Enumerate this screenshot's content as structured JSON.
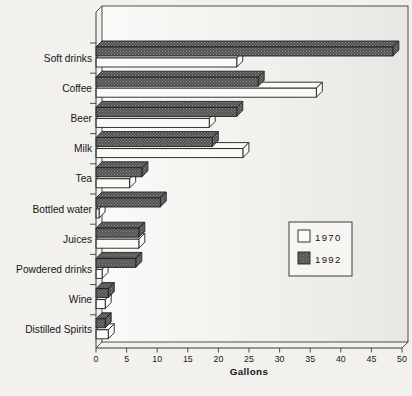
{
  "page": {
    "background": "#f2f1ee"
  },
  "chart_data": {
    "type": "bar",
    "orientation": "horizontal",
    "style": "3d-print-scan",
    "title": "",
    "xlabel": "Gallons",
    "xlim": [
      0,
      50
    ],
    "xticks": [
      0,
      5,
      10,
      15,
      20,
      25,
      30,
      35,
      40,
      45,
      50
    ],
    "grid": false,
    "categories": [
      "Soft drinks",
      "Coffee",
      "Beer",
      "Milk",
      "Tea",
      "Bottled water",
      "Juices",
      "Powdered drinks",
      "Wine",
      "Distilled Spirits"
    ],
    "series": [
      {
        "name": "1970",
        "swatch": "white",
        "values": [
          23,
          36,
          18.5,
          24,
          5.5,
          0.5,
          7,
          1,
          1.5,
          2
        ]
      },
      {
        "name": "1992",
        "swatch": "dark-hatched",
        "values": [
          48.5,
          26.5,
          23,
          19,
          7.5,
          10.5,
          7,
          6.5,
          2,
          1.5
        ]
      }
    ],
    "legend": {
      "position": "middle-right",
      "entries": [
        "1970",
        "1992"
      ]
    },
    "units": "gallons per capita"
  },
  "colors": {
    "bar_1970_fill": "#fbfaf7",
    "bar_1992_base": "#4e4e4e",
    "bar_1992_dot": "#909090",
    "outline": "#1f1f1f",
    "axis": "#3c3c3c",
    "text": "#161616",
    "plot_fill_left": "#fbfaf8",
    "plot_fill_right": "#e9e7e3",
    "legend_fill": "#f6f5f2"
  }
}
